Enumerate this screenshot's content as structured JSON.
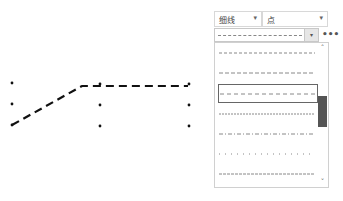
{
  "toolbar": {
    "line_type_combo": {
      "label": "细线",
      "arrow": "▾"
    },
    "point_combo": {
      "label": "点",
      "arrow": "▾"
    },
    "line_style_combo": {
      "arrow": "▾",
      "current_style": "dashed"
    },
    "more_button": "•••"
  },
  "line_style_list": {
    "scroll_up": "˄",
    "scroll_down": "˅",
    "selected_index": 2,
    "items": [
      {
        "style": "dashed-fine",
        "dash": "3 2"
      },
      {
        "style": "dash",
        "dash": "4 2"
      },
      {
        "style": "dash-selected",
        "dash": "4 3"
      },
      {
        "style": "dotted-dense",
        "dash": "2 1"
      },
      {
        "style": "dash-dot",
        "dash": "4 2 1 2"
      },
      {
        "style": "dot-sparse",
        "dash": "1 5"
      },
      {
        "style": "dashed-fine-2",
        "dash": "3 1"
      }
    ]
  },
  "drawing": {
    "stroke_color": "#111111",
    "grid_points": [
      [
        12,
        83
      ],
      [
        12,
        104
      ],
      [
        12,
        125
      ],
      [
        100,
        84
      ],
      [
        100,
        105
      ],
      [
        100,
        126
      ],
      [
        189,
        84
      ],
      [
        189,
        105
      ],
      [
        189,
        126
      ]
    ],
    "polyline": [
      [
        12,
        125
      ],
      [
        82,
        86
      ],
      [
        188,
        86
      ]
    ]
  }
}
